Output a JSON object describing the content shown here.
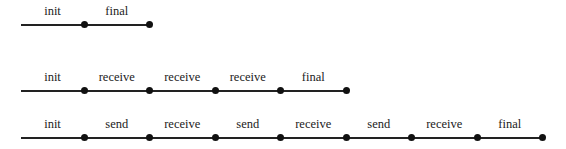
{
  "diagram": {
    "rows": [
      {
        "segments": [
          "init",
          "final"
        ]
      },
      {
        "segments": [
          "init",
          "receive",
          "receive",
          "receive",
          "final"
        ]
      },
      {
        "segments": [
          "init",
          "send",
          "receive",
          "send",
          "receive",
          "send",
          "receive",
          "final"
        ]
      }
    ]
  },
  "layout": {
    "start_x": 21,
    "first_dot_x": 84,
    "segment_width": 65.5,
    "row_line_y": [
      24,
      90,
      137
    ]
  }
}
